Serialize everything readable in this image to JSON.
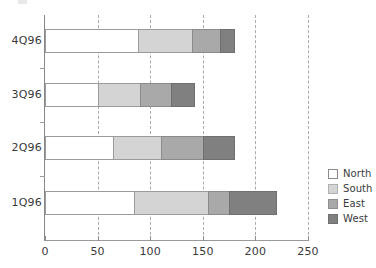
{
  "chart_data": {
    "type": "bar",
    "orientation": "horizontal",
    "stacked": true,
    "title": "",
    "xlabel": "",
    "ylabel": "",
    "categories": [
      "1Q96",
      "2Q96",
      "3Q96",
      "4Q96"
    ],
    "series": [
      {
        "name": "North",
        "values": [
          85,
          65,
          50,
          88
        ],
        "color": "#ffffff"
      },
      {
        "name": "South",
        "values": [
          70,
          45,
          40,
          52
        ],
        "color": "#d4d4d4"
      },
      {
        "name": "East",
        "values": [
          20,
          40,
          30,
          26
        ],
        "color": "#a9a9a9"
      },
      {
        "name": "West",
        "values": [
          45,
          30,
          22,
          14
        ],
        "color": "#808080"
      }
    ],
    "totals": [
      220,
      180,
      142,
      180
    ],
    "xlim": [
      0,
      250
    ],
    "xticks": [
      0,
      50,
      100,
      150,
      200,
      250
    ],
    "xticklabels": [
      "0",
      "50",
      "100",
      "150",
      "200",
      "250"
    ],
    "grid": "vertical-dashed",
    "legend_position": "right"
  },
  "axis": {
    "ticks": [
      {
        "label": "0",
        "value": 0
      },
      {
        "label": "50",
        "value": 50
      },
      {
        "label": "100",
        "value": 100
      },
      {
        "label": "150",
        "value": 150
      },
      {
        "label": "200",
        "value": 200
      },
      {
        "label": "250",
        "value": 250
      }
    ],
    "categories": [
      {
        "label": "4Q96"
      },
      {
        "label": "3Q96"
      },
      {
        "label": "2Q96"
      },
      {
        "label": "1Q96"
      }
    ]
  },
  "legend": {
    "items": [
      {
        "label": "North",
        "color": "#ffffff",
        "border": "#8b8b8b"
      },
      {
        "label": "South",
        "color": "#d4d4d4",
        "border": "#b0b0b0"
      },
      {
        "label": "East",
        "color": "#a9a9a9",
        "border": "#909090"
      },
      {
        "label": "West",
        "color": "#808080",
        "border": "#6f6f6f"
      }
    ]
  },
  "bars": [
    {
      "category": "4Q96",
      "segments": [
        {
          "series": "North",
          "start": 0,
          "end": 88,
          "value": 88
        },
        {
          "series": "South",
          "start": 88,
          "end": 140,
          "value": 52
        },
        {
          "series": "East",
          "start": 140,
          "end": 166,
          "value": 26
        },
        {
          "series": "West",
          "start": 166,
          "end": 180,
          "value": 14
        }
      ]
    },
    {
      "category": "3Q96",
      "segments": [
        {
          "series": "North",
          "start": 0,
          "end": 50,
          "value": 50
        },
        {
          "series": "South",
          "start": 50,
          "end": 90,
          "value": 40
        },
        {
          "series": "East",
          "start": 90,
          "end": 120,
          "value": 30
        },
        {
          "series": "West",
          "start": 120,
          "end": 142,
          "value": 22
        }
      ]
    },
    {
      "category": "2Q96",
      "segments": [
        {
          "series": "North",
          "start": 0,
          "end": 65,
          "value": 65
        },
        {
          "series": "South",
          "start": 65,
          "end": 110,
          "value": 45
        },
        {
          "series": "East",
          "start": 110,
          "end": 150,
          "value": 40
        },
        {
          "series": "West",
          "start": 150,
          "end": 180,
          "value": 30
        }
      ]
    },
    {
      "category": "1Q96",
      "segments": [
        {
          "series": "North",
          "start": 0,
          "end": 85,
          "value": 85
        },
        {
          "series": "South",
          "start": 85,
          "end": 155,
          "value": 70
        },
        {
          "series": "East",
          "start": 155,
          "end": 175,
          "value": 20
        },
        {
          "series": "West",
          "start": 175,
          "end": 220,
          "value": 45
        }
      ]
    }
  ]
}
